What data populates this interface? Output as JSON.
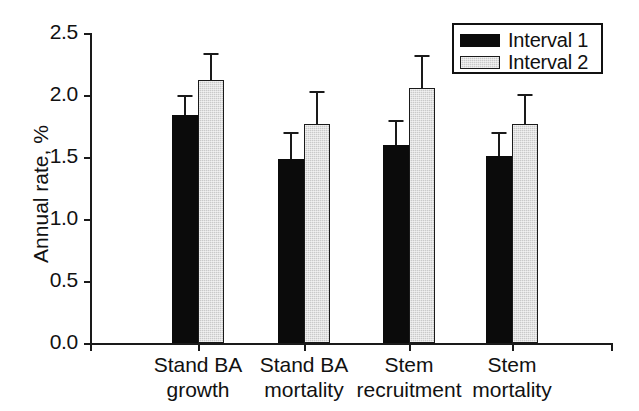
{
  "chart_data": {
    "type": "bar",
    "title": "",
    "xlabel": "",
    "ylabel": "Annual rate, %",
    "ylim": [
      0.0,
      2.5
    ],
    "yticks": [
      "0.0",
      "0.5",
      "1.0",
      "1.5",
      "2.0",
      "2.5"
    ],
    "ytick_values": [
      0.0,
      0.5,
      1.0,
      1.5,
      2.0,
      2.5
    ],
    "grid": false,
    "legend_position": "top-right",
    "categories": [
      "Stand BA\ngrowth",
      "Stand BA\nmortality",
      "Stem\nrecruitment",
      "Stem\nmortality"
    ],
    "series": [
      {
        "name": "Interval 1",
        "color": "#0b0b0b",
        "values": [
          1.84,
          1.48,
          1.6,
          1.51
        ],
        "errors_upper": [
          0.16,
          0.22,
          0.2,
          0.19
        ]
      },
      {
        "name": "Interval 2",
        "color": "#c9c9c9",
        "values": [
          2.12,
          1.77,
          2.06,
          1.77
        ],
        "errors_upper": [
          0.22,
          0.26,
          0.26,
          0.24
        ]
      }
    ]
  },
  "axes": {
    "y_title": "Annual rate, %",
    "ytick_labels": [
      "2.5",
      "2.0",
      "1.5",
      "1.0",
      "0.5",
      "0.0"
    ],
    "xtick_labels": [
      "Stand BA\ngrowth",
      "Stand BA\nmortality",
      "Stem\nrecruitment",
      "Stem\nmortality"
    ]
  },
  "legend": {
    "items": [
      {
        "label": "Interval 1",
        "swatch": "black-bar-swatch"
      },
      {
        "label": "Interval 2",
        "swatch": "gray-bar-swatch"
      }
    ]
  }
}
